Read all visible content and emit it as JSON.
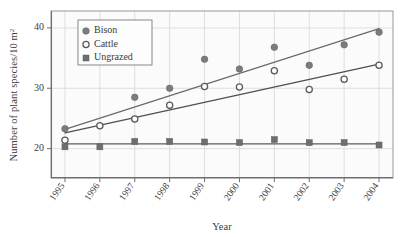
{
  "chart_data": {
    "type": "scatter",
    "title": "",
    "xlabel": "Year",
    "ylabel": "Number of plant species/10 m",
    "ylabel_sup": "2",
    "categories": [
      "1995",
      "1996",
      "1997",
      "1998",
      "1999",
      "2000",
      "2001",
      "2002",
      "2003",
      "2004"
    ],
    "x": [
      1995,
      1996,
      1997,
      1998,
      1999,
      2000,
      2001,
      2002,
      2003,
      2004
    ],
    "xlim": [
      1994.6,
      2004.4
    ],
    "ylim": [
      15.2,
      42.8
    ],
    "yticks": [
      20,
      30,
      40
    ],
    "ytick_labels": [
      "20",
      "30",
      "40"
    ],
    "grid": true,
    "grid_color": "#d7d7d7",
    "legend_position": "top-left",
    "series": [
      {
        "name": "Bison",
        "marker": "filled-circle",
        "color": "#7c7c7c",
        "values": [
          23.3,
          null,
          28.5,
          30.0,
          34.8,
          33.2,
          36.8,
          33.8,
          37.2,
          39.3
        ],
        "trend": {
          "y_start": 23.2,
          "y_end": 39.9,
          "color": "#6b6b6b"
        }
      },
      {
        "name": "Cattle",
        "marker": "open-circle",
        "color": "#5a5a5a",
        "values": [
          21.4,
          23.8,
          24.9,
          27.2,
          30.3,
          30.2,
          32.9,
          29.8,
          31.5,
          33.8
        ],
        "trend": {
          "y_start": 22.6,
          "y_end": 34.0,
          "color": "#4f4f4f"
        }
      },
      {
        "name": "Ungrazed",
        "marker": "filled-square",
        "color": "#6e6e6e",
        "values": [
          20.3,
          20.3,
          21.2,
          21.2,
          21.1,
          21.0,
          21.5,
          21.0,
          21.0,
          20.6
        ],
        "trend": {
          "y_start": 20.8,
          "y_end": 20.8,
          "color": "#5c5c5c"
        }
      }
    ]
  },
  "legend": {
    "items": [
      {
        "label": "Bison",
        "marker": "filled-circle"
      },
      {
        "label": "Cattle",
        "marker": "open-circle"
      },
      {
        "label": "Ungrazed",
        "marker": "filled-square"
      }
    ]
  },
  "axes": {
    "y_title_main": "Number of plant species/10 m",
    "y_title_sup": "2",
    "x_title": "Year",
    "y_ticks": [
      "20",
      "30",
      "40"
    ],
    "x_ticks": [
      "1995",
      "1996",
      "1997",
      "1998",
      "1999",
      "2000",
      "2001",
      "2002",
      "2003",
      "2004"
    ]
  }
}
